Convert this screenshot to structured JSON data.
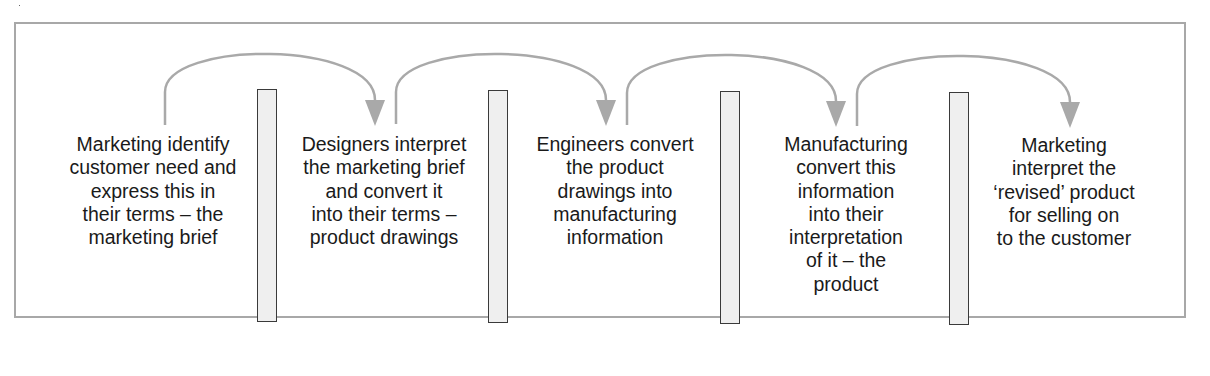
{
  "diagram": {
    "type": "process-flow",
    "stages": [
      {
        "id": "marketing-identify",
        "lines": [
          "Marketing identify",
          "customer need and",
          "express this in",
          "their terms – the",
          "marketing brief"
        ]
      },
      {
        "id": "designers-interpret",
        "lines": [
          "Designers interpret",
          "the marketing brief",
          "and convert it",
          "into their terms –",
          "product drawings"
        ]
      },
      {
        "id": "engineers-convert",
        "lines": [
          "Engineers convert",
          "the product",
          "drawings into",
          "manufacturing",
          "information"
        ]
      },
      {
        "id": "manufacturing-convert",
        "lines": [
          "Manufacturing",
          "convert this",
          "information",
          "into their",
          "interpretation",
          "of it – the",
          "product"
        ]
      },
      {
        "id": "marketing-interpret",
        "lines": [
          "Marketing",
          "interpret the",
          "‘revised’ product",
          "for selling on",
          "to the customer"
        ]
      }
    ],
    "dividers": 4,
    "arrows": [
      {
        "from": 0,
        "to": 1
      },
      {
        "from": 1,
        "to": 2
      },
      {
        "from": 2,
        "to": 3
      },
      {
        "from": 3,
        "to": 4
      }
    ],
    "colors": {
      "arrow": "#a9a9a9",
      "divider_fill": "#efefef",
      "divider_border": "#3a3a3a",
      "frame": "#a8a8a8",
      "text": "#1a1a1a"
    }
  }
}
